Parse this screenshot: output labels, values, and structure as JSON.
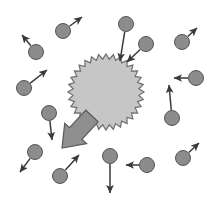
{
  "figure": {
    "width": 213,
    "height": 206,
    "background_color": "#ffffff"
  },
  "colors": {
    "particle_fill": "#8c8c8c",
    "particle_stroke": "#555555",
    "burst_fill": "#c6c6c6",
    "burst_stroke": "#6e6e6e",
    "arrow_stroke": "#3a3a3a",
    "block_arrow_fill": "#8f8f8f",
    "block_arrow_stroke": "#5a5a5a"
  },
  "burst": {
    "name": "central-burst",
    "center_x": 106,
    "center_y": 92,
    "outer_radius": 38,
    "inner_radius": 33,
    "teeth": 32,
    "fill": "#c6c6c6",
    "stroke": "#6e6e6e"
  },
  "block_arrow": {
    "name": "emission-block-arrow",
    "from_x": 92,
    "from_y": 116,
    "to_x": 62,
    "to_y": 148,
    "shaft_width": 17,
    "head_width": 30,
    "head_length": 20,
    "fill": "#8f8f8f",
    "stroke": "#5a5a5a"
  },
  "particles": [
    {
      "name": "particle-top-left-outer",
      "cx": 36,
      "cy": 52,
      "r": 7.5,
      "arrow_to_x": 22,
      "arrow_to_y": 35,
      "direction": "up-left"
    },
    {
      "name": "particle-upper-left",
      "cx": 63,
      "cy": 31,
      "r": 7.5,
      "arrow_to_x": 82,
      "arrow_to_y": 17,
      "direction": "up-right"
    },
    {
      "name": "particle-mid-left",
      "cx": 24,
      "cy": 88,
      "r": 7.5,
      "arrow_to_x": 47,
      "arrow_to_y": 70,
      "direction": "up-right"
    },
    {
      "name": "particle-left-lower",
      "cx": 49,
      "cy": 113,
      "r": 7.5,
      "arrow_to_x": 52,
      "arrow_to_y": 140,
      "direction": "down"
    },
    {
      "name": "particle-bottom-left",
      "cx": 35,
      "cy": 152,
      "r": 7.5,
      "arrow_to_x": 20,
      "arrow_to_y": 172,
      "direction": "down-left"
    },
    {
      "name": "particle-bottom-mid-left",
      "cx": 60,
      "cy": 176,
      "r": 7.5,
      "arrow_to_x": 79,
      "arrow_to_y": 155,
      "direction": "up-right"
    },
    {
      "name": "particle-bottom-center",
      "cx": 110,
      "cy": 156,
      "r": 7.5,
      "arrow_to_x": 110,
      "arrow_to_y": 193,
      "direction": "down"
    },
    {
      "name": "particle-bottom-right-inner",
      "cx": 147,
      "cy": 165,
      "r": 7.5,
      "arrow_to_x": 126,
      "arrow_to_y": 165,
      "direction": "left"
    },
    {
      "name": "particle-bottom-right-outer",
      "cx": 183,
      "cy": 158,
      "r": 7.5,
      "arrow_to_x": 199,
      "arrow_to_y": 143,
      "direction": "up-right"
    },
    {
      "name": "particle-right-lower",
      "cx": 172,
      "cy": 118,
      "r": 7.5,
      "arrow_to_x": 169,
      "arrow_to_y": 85,
      "direction": "up"
    },
    {
      "name": "particle-right-mid",
      "cx": 196,
      "cy": 78,
      "r": 7.5,
      "arrow_to_x": 174,
      "arrow_to_y": 78,
      "direction": "left"
    },
    {
      "name": "particle-right-upper",
      "cx": 182,
      "cy": 42,
      "r": 7.5,
      "arrow_to_x": 197,
      "arrow_to_y": 28,
      "direction": "up-right"
    },
    {
      "name": "particle-incoming-top",
      "cx": 126,
      "cy": 24,
      "r": 7.5,
      "arrow_to_x": 120,
      "arrow_to_y": 61,
      "direction": "down-into-burst"
    },
    {
      "name": "particle-incoming-upper-right",
      "cx": 146,
      "cy": 44,
      "r": 7.5,
      "arrow_to_x": 127,
      "arrow_to_y": 62,
      "direction": "down-left-into-burst"
    }
  ]
}
